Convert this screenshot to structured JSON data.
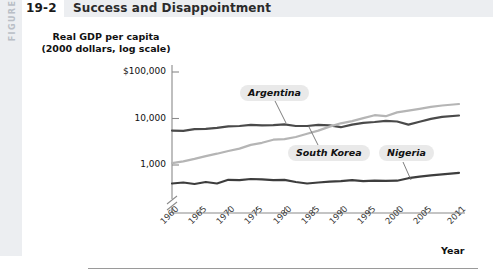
{
  "figure": {
    "band_label": "FIGURE",
    "number": "19-2",
    "title": "Success and Disappointment"
  },
  "chart_data": {
    "type": "line",
    "title": "Success and Disappointment",
    "ylabel_line1": "Real GDP per capita",
    "ylabel_line2": "(2000 dollars, log scale)",
    "xlabel": "Year",
    "yscale": "log",
    "ylim": [
      300,
      100000
    ],
    "y_ticks": [
      "$100,000",
      "10,000",
      "1,000"
    ],
    "y_tick_values": [
      100000,
      10000,
      1000
    ],
    "axis_break": true,
    "grid": false,
    "legend_position": "inline-callouts",
    "x_ticks": [
      "1960",
      "1965",
      "1970",
      "1975",
      "1980",
      "1985",
      "1990",
      "1995",
      "2000",
      "2005",
      "2011"
    ],
    "x_tick_values": [
      1960,
      1965,
      1970,
      1975,
      1980,
      1985,
      1990,
      1995,
      2000,
      2005,
      2011
    ],
    "xlim": [
      1960,
      2011
    ],
    "x": [
      1960,
      1962,
      1964,
      1966,
      1968,
      1970,
      1972,
      1974,
      1976,
      1978,
      1980,
      1982,
      1984,
      1986,
      1988,
      1990,
      1992,
      1994,
      1996,
      1998,
      2000,
      2002,
      2004,
      2006,
      2008,
      2011
    ],
    "series": [
      {
        "name": "Argentina",
        "color": "#4a4a4a",
        "values": [
          5500,
          5400,
          5900,
          6000,
          6300,
          6800,
          6900,
          7300,
          7100,
          7200,
          7500,
          6900,
          6900,
          7300,
          7100,
          6500,
          7400,
          8100,
          8400,
          8900,
          8600,
          7400,
          8500,
          9800,
          10800,
          11600
        ]
      },
      {
        "name": "South Korea",
        "color": "#b5b5b5",
        "values": [
          1100,
          1200,
          1350,
          1550,
          1750,
          2000,
          2250,
          2700,
          3000,
          3500,
          3600,
          4000,
          4700,
          5500,
          6700,
          7900,
          8800,
          10200,
          11800,
          11200,
          13500,
          14800,
          16200,
          17800,
          19000,
          20500
        ]
      },
      {
        "name": "Nigeria",
        "color": "#3d3d3d",
        "values": [
          400,
          420,
          390,
          430,
          400,
          480,
          470,
          500,
          490,
          470,
          480,
          430,
          400,
          420,
          440,
          450,
          470,
          450,
          460,
          455,
          460,
          520,
          560,
          600,
          630,
          680
        ]
      }
    ],
    "annotations": [
      {
        "label": "Argentina",
        "target_year": 1978
      },
      {
        "label": "South Korea",
        "target_year": 1988
      },
      {
        "label": "Nigeria",
        "target_year": 2002
      }
    ]
  }
}
